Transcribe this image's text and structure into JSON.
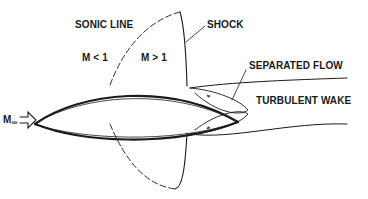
{
  "diagram": {
    "type": "transonic airfoil flow",
    "labels": {
      "sonic_line": "SONIC LINE",
      "shock": "SHOCK",
      "subsonic": "M < 1",
      "supersonic": "M > 1",
      "separated_flow": "SEPARATED FLOW",
      "turbulent_wake": "TURBULENT WAKE",
      "freestream": "M",
      "freestream_sub": "∞"
    },
    "colors": {
      "stroke": "#1a1a1a",
      "background": "#ffffff"
    }
  }
}
